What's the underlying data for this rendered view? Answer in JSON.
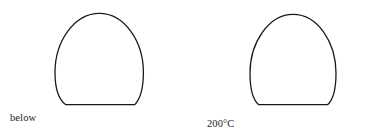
{
  "figure": {
    "background_color": "#ffffff",
    "stroke_color": "#1a1a1a",
    "stroke_width": 1.3,
    "width": 376,
    "height": 131,
    "drops": [
      {
        "id": "drop-left",
        "label": "below\n0°C",
        "label_line_1": "below",
        "label_line_2": "0°C",
        "temperature": "below 0°C",
        "left": 55,
        "right": 143,
        "top": 13,
        "baseline_y": 105,
        "contact_left_x": 65,
        "contact_right_x": 135,
        "outline_path": "M 65.5 104.6 C 58.2 99.0 55.0 88.5 55.0 72.5 C 55.0 41.0 74.5 13.3 99.4 13.3 C 124.2 13.3 143.4 41.0 143.4 72.5 C 143.4 88.6 140.0 99.1 134.8 104.6 Z"
      },
      {
        "id": "drop-right",
        "label": "200°C",
        "label_line_1": "200°C",
        "label_line_2": "",
        "temperature": "200°C",
        "left": 250,
        "right": 336,
        "top": 14,
        "baseline_y": 105,
        "contact_left_x": 258,
        "contact_right_x": 328,
        "outline_path": "M 258.5 104.6 C 252.4 99.2 250.0 88.8 250.0 73.0 C 250.0 42.0 269.0 14.3 293.2 14.3 C 317.4 14.3 336.0 42.0 336.0 73.0 C 336.0 88.8 333.6 99.2 327.8 104.6 Z"
      }
    ]
  },
  "labels": {
    "left_line_1": "below",
    "left_line_2": "0°C",
    "right_line_1": "200°C"
  }
}
